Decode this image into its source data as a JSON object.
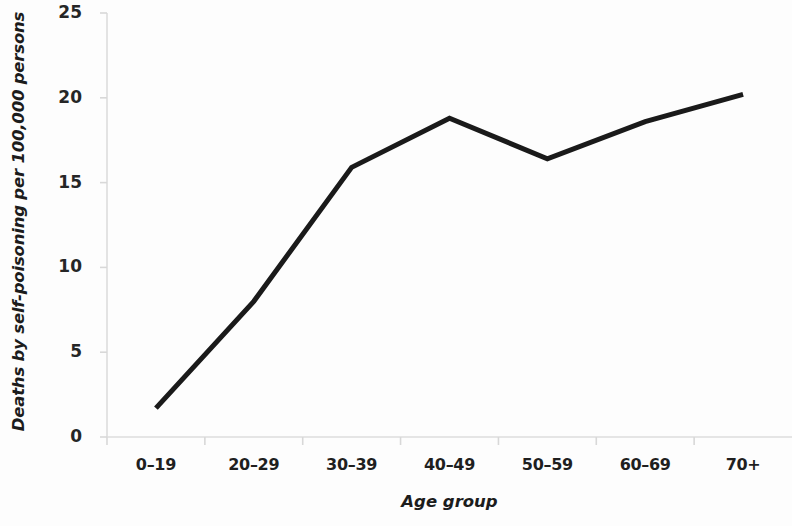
{
  "chart_data": {
    "type": "line",
    "title": "",
    "subtitle": "",
    "xlabel": "Age group",
    "ylabel": "Deaths by self-poisoning per 100,000 persons",
    "categories": [
      "0–19",
      "20–29",
      "30–39",
      "40–49",
      "50–59",
      "60–69",
      "70+"
    ],
    "series": [
      {
        "name": "Deaths by self-poisoning per 100,000 persons",
        "values": [
          1.7,
          8.0,
          15.9,
          18.8,
          16.4,
          18.6,
          20.2
        ],
        "color": "#1a1a1a"
      }
    ],
    "ylim": [
      0,
      25
    ],
    "ytick_labels": [
      "0",
      "5",
      "10",
      "15",
      "20",
      "25"
    ],
    "ytick_values": [
      0,
      5,
      10,
      15,
      20,
      25
    ],
    "grid": false,
    "legend": false,
    "legend_position": "none",
    "line_width_px": 5,
    "markers": false,
    "axis_color": "#d8d8d8",
    "background_color": "#ffffff"
  }
}
